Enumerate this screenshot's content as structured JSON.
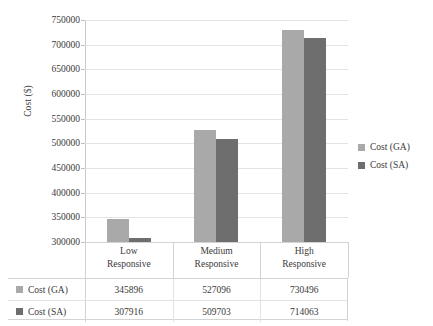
{
  "chart_data": {
    "type": "bar",
    "title": "",
    "xlabel": "",
    "ylabel": "Cost ($)",
    "ylim": [
      300000,
      750000
    ],
    "ytick_step": 50000,
    "yticks": [
      "300000",
      "350000",
      "400000",
      "450000",
      "500000",
      "550000",
      "600000",
      "650000",
      "700000",
      "750000"
    ],
    "categories": [
      "Low Responsive",
      "Medium Responsive",
      "High Responsive"
    ],
    "category_lines": [
      [
        "Low",
        "Responsive"
      ],
      [
        "Medium",
        "Responsive"
      ],
      [
        "High",
        "Responsive"
      ]
    ],
    "series": [
      {
        "name": "Cost (GA)",
        "color": "#a9a9a9",
        "values": [
          345896,
          527096,
          730496
        ]
      },
      {
        "name": "Cost (SA)",
        "color": "#6e6e6e",
        "values": [
          307916,
          509703,
          714063
        ]
      }
    ],
    "grid": true,
    "legend_position": "right",
    "data_table": {
      "row_headers": [
        "Cost (GA)",
        "Cost (SA)"
      ],
      "columns": [
        "Low Responsive",
        "Medium Responsive",
        "High Responsive"
      ],
      "rows": [
        [
          "345896",
          "527096",
          "730496"
        ],
        [
          "307916",
          "509703",
          "714063"
        ]
      ]
    }
  },
  "legend": {
    "items": [
      {
        "label": "Cost (GA)",
        "color": "#a9a9a9"
      },
      {
        "label": "Cost (SA)",
        "color": "#6e6e6e"
      }
    ]
  }
}
